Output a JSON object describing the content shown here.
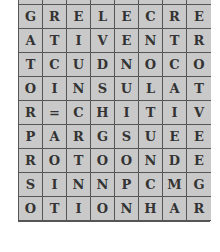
{
  "puzzle": {
    "type": "word-search",
    "columns": 8,
    "rows": [
      [
        "",
        "",
        "",
        "",
        "",
        "",
        "",
        ""
      ],
      [
        "G",
        "R",
        "E",
        "L",
        "E",
        "C",
        "R",
        "E"
      ],
      [
        "A",
        "T",
        "I",
        "V",
        "E",
        "N",
        "T",
        "R"
      ],
      [
        "T",
        "C",
        "U",
        "D",
        "N",
        "O",
        "C",
        "O"
      ],
      [
        "O",
        "I",
        "N",
        "S",
        "U",
        "L",
        "A",
        "T"
      ],
      [
        "R",
        "=",
        "C",
        "H",
        "I",
        "T",
        "I",
        "V"
      ],
      [
        "P",
        "A",
        "R",
        "G",
        "S",
        "U",
        "E",
        "E"
      ],
      [
        "R",
        "O",
        "T",
        "O",
        "O",
        "N",
        "D",
        "E"
      ],
      [
        "S",
        "I",
        "N",
        "N",
        "P",
        "C",
        "M",
        "G"
      ],
      [
        "O",
        "T",
        "I",
        "O",
        "N",
        "H",
        "A",
        "R"
      ]
    ]
  }
}
